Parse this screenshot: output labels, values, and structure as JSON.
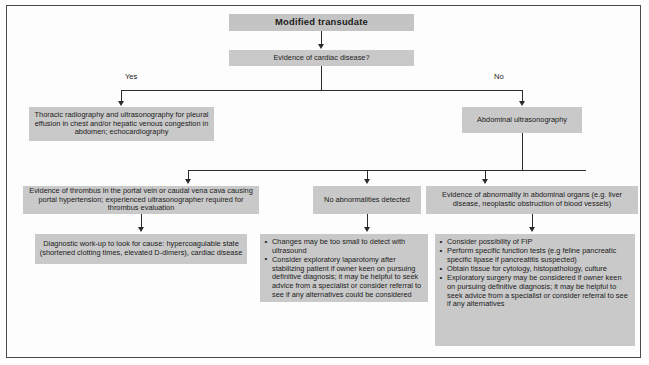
{
  "diagram": {
    "title_box": {
      "label": "Modified transudate"
    },
    "decision": {
      "label": "Evidence of cardiac disease?"
    },
    "branch_labels": {
      "yes": "Yes",
      "no": "No"
    },
    "boxes": {
      "thoracic": {
        "label": "Thoracic radiography and ultrasonography for pleural effusion in chest and/or hepatic venous congestion in abdomen; echocardiography"
      },
      "abdominal": {
        "label": "Abdominal ultrasonography"
      },
      "thrombus": {
        "label": "Evidence of thrombus in the portal vein or caudal vena cava causing portal hypertension; experienced ultrasonographer required for thrombus evaluation"
      },
      "no_abnormalities": {
        "label": "No abnormalities detected"
      },
      "abnormality": {
        "label": "Evidence of abnormality in abdominal organs (e.g. liver disease, neoplastic obstruction of blood vessels)"
      },
      "diagnostic_workup": {
        "label": "Diagnostic work-up to look for cause: hypercoagulable state (shortened clotting times, elevated D-dimers), cardiac disease"
      }
    },
    "middle_actions": {
      "items": [
        "Changes may be too small to detect with ultrasound",
        "Consider exploratory laparotomy after stabilizing patient if owner keen on pursuing definitive diagnosis; it may be helpful to seek advice from a specialist or consider referral to see if any alternatives could be considered"
      ]
    },
    "right_actions": {
      "items": [
        "Consider possibility of FIP",
        "Perform specific function tests (e.g feline pancreatic specific lipase if pancreatitis suspected)",
        "Obtain tissue for cytology, histopathology, culture",
        "Exploratory surgery may be considered if owner keen on pursuing definitive diagnosis; it may be helpful to seek advice from a specialist or consider referral to see if any alternatives"
      ]
    },
    "colors": {
      "box_fill": "#c9c9c9",
      "line": "#2b2b2b",
      "frame": "#4a4a4a",
      "page": "#fdfdfd"
    }
  }
}
